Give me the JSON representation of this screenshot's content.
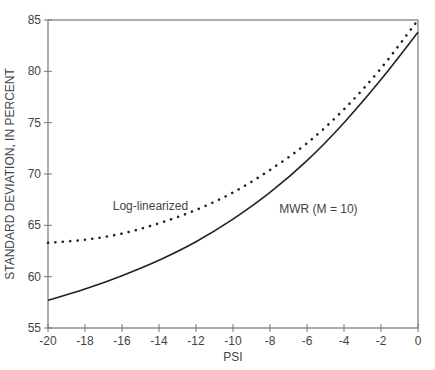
{
  "chart_data": {
    "type": "line",
    "title": "",
    "xlabel": "PSI",
    "ylabel": "STANDARD DEVIATION, IN PERCENT",
    "xlim": [
      -20,
      0
    ],
    "ylim": [
      55,
      85
    ],
    "grid": false,
    "legend": "inline annotations",
    "x_ticks": [
      "-20",
      "-18",
      "-16",
      "-14",
      "-12",
      "-10",
      "-8",
      "-6",
      "-4",
      "-2",
      "0"
    ],
    "y_ticks": [
      "55",
      "60",
      "65",
      "70",
      "75",
      "80",
      "85"
    ],
    "x": [
      -20,
      -18,
      -16,
      -14,
      -12,
      -10,
      -8,
      -6,
      -4,
      -2,
      0
    ],
    "series": [
      {
        "name": "Log-linearized",
        "style": "dotted",
        "values": [
          63.3,
          63.6,
          64.2,
          65.2,
          66.5,
          68.2,
          70.4,
          73.0,
          76.3,
          80.3,
          85.0
        ]
      },
      {
        "name": "MWR (M = 10)",
        "style": "solid",
        "values": [
          57.7,
          58.8,
          60.1,
          61.6,
          63.4,
          65.6,
          68.2,
          71.3,
          75.0,
          79.2,
          83.8
        ]
      }
    ],
    "annotations": [
      {
        "text": "Log-linearized",
        "x": -16.5,
        "y": 66.5
      },
      {
        "text": "MWR (M = 10)",
        "x": -7.5,
        "y": 66.2
      }
    ]
  }
}
